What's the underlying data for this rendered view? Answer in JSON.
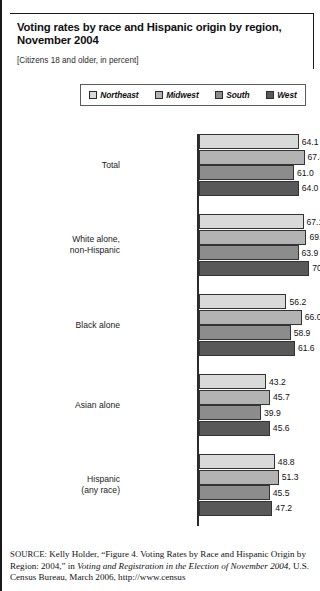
{
  "figure": {
    "title": "Voting rates by race and Hispanic origin by region, November 2004",
    "subtitle": "[Citizens 18 and older, in percent]"
  },
  "legend": {
    "items": [
      {
        "label": "Northeast",
        "color": "#d9d9d9"
      },
      {
        "label": "Midwest",
        "color": "#b3b3b3"
      },
      {
        "label": "South",
        "color": "#8c8c8c"
      },
      {
        "label": "West",
        "color": "#595959"
      }
    ]
  },
  "source": {
    "prefix": "SOURCE:",
    "part1": " Kelly Holder, “Figure 4. Voting Rates by Race and Hispanic Origin by Region: 2004,” in ",
    "italic": "Voting and Registration in the Election of November 2004",
    "part2": ", U.S. Census Bureau, March 2006, http://www.census"
  },
  "chart_data": {
    "type": "bar",
    "orientation": "horizontal",
    "title": "Voting rates by race and Hispanic origin by region, November 2004",
    "subtitle": "[Citizens 18 and older, in percent]",
    "xlabel": "",
    "ylabel": "",
    "xlim": [
      0,
      78
    ],
    "grid": false,
    "legend_position": "top",
    "categories": [
      "Total",
      "White alone, non-Hispanic",
      "Black alone",
      "Asian alone",
      "Hispanic (any race)"
    ],
    "category_lines": [
      [
        "Total"
      ],
      [
        "White alone,",
        "non-Hispanic"
      ],
      [
        "Black alone"
      ],
      [
        "Asian alone"
      ],
      [
        "Hispanic",
        "(any race)"
      ]
    ],
    "series": [
      {
        "name": "Northeast",
        "color": "#d9d9d9",
        "values": [
          64.1,
          67.1,
          56.2,
          43.2,
          48.8
        ]
      },
      {
        "name": "Midwest",
        "color": "#b3b3b3",
        "values": [
          67.8,
          69.0,
          66.0,
          45.7,
          51.3
        ]
      },
      {
        "name": "South",
        "color": "#8c8c8c",
        "values": [
          61.0,
          63.9,
          58.9,
          39.9,
          45.5
        ]
      },
      {
        "name": "West",
        "color": "#595959",
        "values": [
          64.0,
          70.7,
          61.6,
          45.6,
          47.2
        ]
      }
    ],
    "value_labels": [
      [
        "64.1",
        "67.8",
        "61.0",
        "64.0"
      ],
      [
        "67.1",
        "69.0",
        "63.9",
        "70.7"
      ],
      [
        "56.2",
        "66.0",
        "58.9",
        "61.6"
      ],
      [
        "43.2",
        "45.7",
        "39.9",
        "45.6"
      ],
      [
        "48.8",
        "51.3",
        "45.5",
        "47.2"
      ]
    ]
  }
}
